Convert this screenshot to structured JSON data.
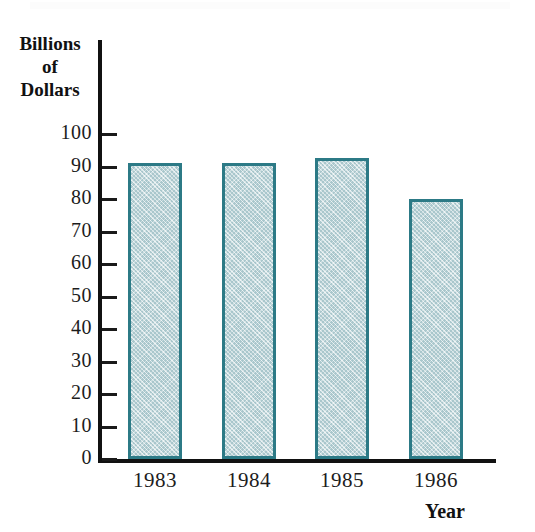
{
  "chart_data": {
    "type": "bar",
    "title": "",
    "subtitle": "",
    "xlabel": "Year",
    "ylabel": "Billions of Dollars",
    "ylabel_lines": [
      "Billions",
      "of",
      "Dollars"
    ],
    "categories": [
      "1983",
      "1984",
      "1985",
      "1986"
    ],
    "values": [
      91,
      91,
      92.5,
      80
    ],
    "ytick_labels": [
      "100",
      "90",
      "80",
      "70",
      "60",
      "50",
      "40",
      "30",
      "20",
      "10",
      "0"
    ],
    "ytick_values": [
      100,
      90,
      80,
      70,
      60,
      50,
      40,
      30,
      20,
      10,
      0
    ],
    "ylim": [
      0,
      100
    ],
    "grid": false,
    "legend": false,
    "legend_position": "none",
    "bar_fill_color": "#c5d8dc",
    "bar_border_color": "#2c7a86",
    "axis_color": "#111111",
    "text_color": "#1c1c1c",
    "background_color": "#ffffff"
  }
}
